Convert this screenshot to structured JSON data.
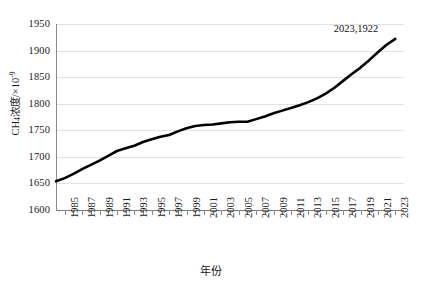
{
  "chart_data": {
    "type": "line",
    "title": "",
    "xlabel": "年份",
    "ylabel": "CH4浓度/×10-9",
    "ylabel_parts": {
      "prefix": "CH",
      "sub": "4",
      "mid": "浓度/×10",
      "sup": "-9"
    },
    "xlim": [
      1984,
      2024
    ],
    "ylim": [
      1600,
      1950
    ],
    "yticks": [
      1600,
      1650,
      1700,
      1750,
      1800,
      1850,
      1900,
      1950
    ],
    "ytick_labels": [
      "1600",
      "1650",
      "1700",
      "1750",
      "1800",
      "1850",
      "1900",
      "1950"
    ],
    "xticks": [
      1985,
      1987,
      1989,
      1991,
      1993,
      1995,
      1997,
      1999,
      2001,
      2003,
      2005,
      2007,
      2009,
      2011,
      2013,
      2015,
      2017,
      2019,
      2021,
      2023
    ],
    "xtick_labels": [
      "1985",
      "1987",
      "1989",
      "1991",
      "1993",
      "1995",
      "1997",
      "1999",
      "2001",
      "2003",
      "2005",
      "2007",
      "2009",
      "2011",
      "2013",
      "2015",
      "2017",
      "2019",
      "2021",
      "2023"
    ],
    "grid": true,
    "grid_axis": "y",
    "legend": "none",
    "line_color": "#000000",
    "line_width": 2.6,
    "annotations": [
      {
        "text": "2023,1922",
        "x": 2021.2,
        "y": 1941
      }
    ],
    "x": [
      1984,
      1985,
      1986,
      1987,
      1988,
      1989,
      1990,
      1991,
      1992,
      1993,
      1994,
      1995,
      1996,
      1997,
      1998,
      1999,
      2000,
      2001,
      2002,
      2003,
      2004,
      2005,
      2006,
      2007,
      2008,
      2009,
      2010,
      2011,
      2012,
      2013,
      2014,
      2015,
      2016,
      2017,
      2018,
      2019,
      2020,
      2021,
      2022,
      2023
    ],
    "values": [
      1654,
      1660,
      1668,
      1677,
      1685,
      1693,
      1702,
      1711,
      1716,
      1721,
      1728,
      1733,
      1738,
      1741,
      1748,
      1754,
      1758,
      1760,
      1761,
      1763,
      1765,
      1766,
      1766,
      1771,
      1776,
      1782,
      1787,
      1792,
      1797,
      1803,
      1810,
      1819,
      1830,
      1843,
      1856,
      1868,
      1882,
      1897,
      1911,
      1922
    ]
  }
}
